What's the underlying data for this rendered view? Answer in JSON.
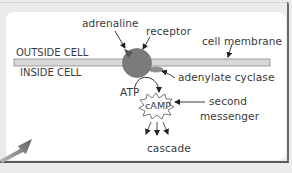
{
  "diagram": {
    "labels": {
      "adrenaline": "adrenaline",
      "receptor": "receptor",
      "cell_membrane": "cell membrane",
      "outside_cell": "OUTSIDE CELL",
      "inside_cell": "INSIDE CELL",
      "adenylate_cyclase": "adenylate cyclase",
      "atp": "ATP",
      "camp": "cAMP",
      "second": "second",
      "messenger": "messenger",
      "cascade": "cascade"
    },
    "colors": {
      "background": "#ebebeb",
      "panel": "#ffffff",
      "membrane_fill": "#d8d8d8",
      "membrane_stroke": "#8a8a8a",
      "receptor": "#7b7b7b",
      "text": "#3a3a3a",
      "pointer_arrow": "#6f6f6f"
    },
    "icons": {
      "pointer": "large-arrow-up-right",
      "camp_shape": "starburst"
    }
  }
}
